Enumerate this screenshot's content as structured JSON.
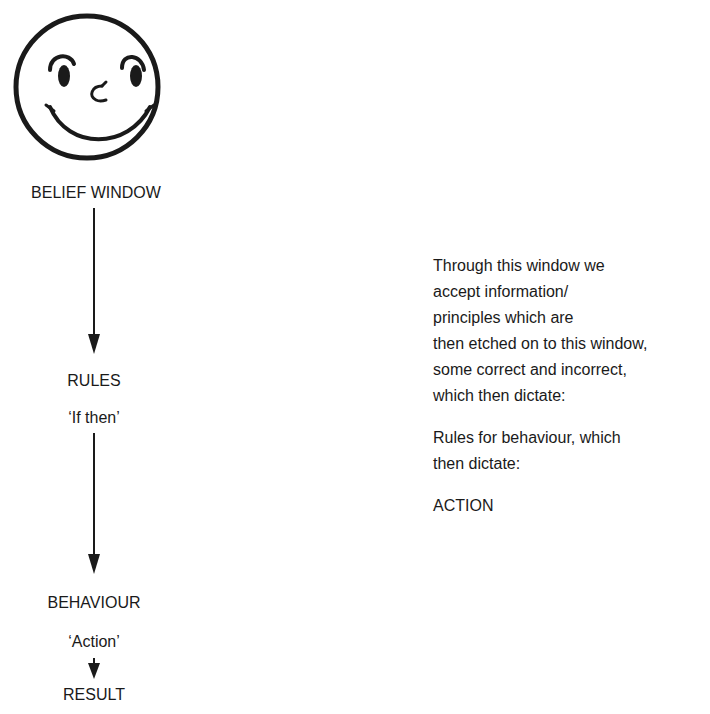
{
  "diagram": {
    "icon": "smiley-face-icon",
    "flow": [
      {
        "label": "BELIEF WINDOW"
      },
      {
        "label": "RULES",
        "sublabel": "‘If then’"
      },
      {
        "label": "BEHAVIOUR",
        "sublabel": "‘Action’"
      },
      {
        "label": "RESULT"
      }
    ],
    "description": {
      "paragraph1_lines": [
        "Through this window we",
        "accept information/",
        "principles which are",
        "then etched on to this window,",
        "some correct and incorrect,",
        "which then dictate:"
      ],
      "paragraph2_lines": [
        "Rules for behaviour, which",
        "then dictate:"
      ],
      "paragraph3": "ACTION"
    },
    "colors": {
      "ink": "#1a1a1a",
      "background": "#ffffff"
    }
  }
}
